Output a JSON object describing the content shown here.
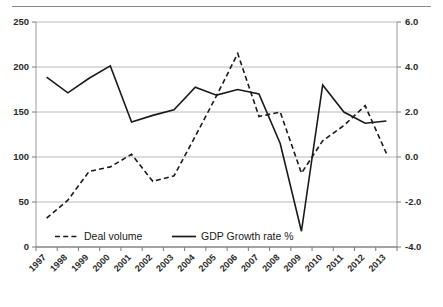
{
  "chart_data": {
    "type": "line",
    "title": "",
    "xlabel": "",
    "ylabel": "",
    "grid": true,
    "legend_position": "inside-bottom",
    "categories": [
      "1997",
      "1998",
      "1999",
      "2000",
      "2001",
      "2002",
      "2003",
      "2004",
      "2005",
      "2006",
      "2007",
      "2008",
      "2009",
      "2010",
      "2011",
      "2012",
      "2013"
    ],
    "axes": {
      "left": {
        "label": "",
        "min": 0,
        "max": 250,
        "ticks": [
          0,
          50,
          100,
          150,
          200,
          250
        ],
        "tick_labels": [
          "0",
          "50",
          "100",
          "150",
          "200",
          "250"
        ]
      },
      "right": {
        "label": "",
        "min": -4.0,
        "max": 6.0,
        "ticks": [
          -4.0,
          -2.0,
          0.0,
          2.0,
          4.0,
          6.0
        ],
        "tick_labels": [
          "-4.0",
          "-2.0",
          "0.0",
          "2.0",
          "4.0",
          "6.0"
        ]
      }
    },
    "series": [
      {
        "name": "Deal volume",
        "axis": "left",
        "style": "dashed",
        "color": "#1a1a1a",
        "values": [
          32,
          52,
          84,
          89,
          103,
          73,
          79,
          123,
          168,
          215,
          145,
          150,
          82,
          118,
          135,
          157,
          104
        ]
      },
      {
        "name": "GDP Growth rate %",
        "axis": "right",
        "style": "solid",
        "color": "#1a1a1a",
        "values": [
          3.55,
          2.85,
          3.5,
          4.05,
          1.55,
          1.85,
          2.1,
          3.1,
          2.75,
          3.0,
          2.8,
          0.6,
          -3.3,
          3.2,
          2.0,
          1.5,
          1.6
        ]
      }
    ]
  },
  "legend": {
    "items": [
      {
        "label": "Deal volume",
        "style": "dashed"
      },
      {
        "label": "GDP Growth rate %",
        "style": "solid"
      }
    ]
  }
}
